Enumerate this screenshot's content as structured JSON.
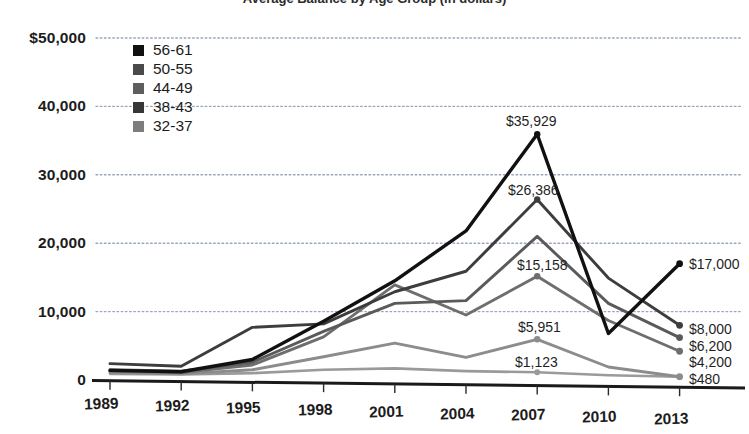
{
  "chart_data": {
    "type": "line",
    "title": "Average Balance by Age Group (in dollars)",
    "xlabel": "",
    "ylabel": "",
    "x": [
      "1989",
      "1992",
      "1995",
      "1998",
      "2001",
      "2004",
      "2007",
      "2010",
      "2013"
    ],
    "categories": [
      "1989",
      "1992",
      "1995",
      "1998",
      "2001",
      "2004",
      "2007",
      "2010",
      "2013"
    ],
    "ytick_labels": [
      "$50,000",
      "40,000",
      "30,000",
      "20,000",
      "10,000",
      "0"
    ],
    "ytick_values": [
      50000,
      40000,
      30000,
      20000,
      10000,
      0
    ],
    "ylim": [
      0,
      50000
    ],
    "grid": true,
    "legend_position": "upper-left-inside",
    "series": [
      {
        "name": "56-61",
        "color": "#111111",
        "values": [
          1400,
          1200,
          3000,
          8600,
          14500,
          21800,
          35929,
          6800,
          17000
        ],
        "end_label": "$17,000",
        "peak_label": "$35,929"
      },
      {
        "name": "50-55",
        "color": "#3d3d3d",
        "values": [
          2400,
          2000,
          7700,
          8200,
          12900,
          15900,
          26386,
          14900,
          8000
        ],
        "end_label": "$8,000",
        "peak_label": "$26,386"
      },
      {
        "name": "44-49",
        "color": "#5a5a5a",
        "values": [
          1500,
          1300,
          2600,
          7100,
          11200,
          11600,
          21000,
          11200,
          6200
        ],
        "end_label": "$6,200",
        "peak_label": ""
      },
      {
        "name": "38-43",
        "color": "#6e6e6e",
        "values": [
          1300,
          1100,
          2200,
          6300,
          13900,
          9500,
          15158,
          8700,
          4200
        ],
        "end_label": "$4,200",
        "peak_label": "$15,158"
      },
      {
        "name": "32-37",
        "color": "#8c8c8c",
        "values": [
          1100,
          900,
          1500,
          3400,
          5400,
          3300,
          5951,
          1900,
          480
        ],
        "end_label": "$480",
        "peak_label": "$5,951"
      }
    ],
    "annotations": [
      {
        "text": "$35,929",
        "series": "56-61",
        "x": "2007",
        "value": 35929
      },
      {
        "text": "$26,386",
        "series": "50-55",
        "x": "2007",
        "value": 26386
      },
      {
        "text": "$15,158",
        "series": "38-43",
        "x": "2007",
        "value": 15158
      },
      {
        "text": "$5,951",
        "series": "32-37",
        "x": "2007",
        "value": 5951
      },
      {
        "text": "$1,123",
        "series": "32-37-low",
        "x": "2007",
        "value": 1123
      },
      {
        "text": "$17,000",
        "series": "56-61",
        "x": "2013",
        "value": 17000
      },
      {
        "text": "$8,000",
        "series": "50-55",
        "x": "2013",
        "value": 8000
      },
      {
        "text": "$6,200",
        "series": "44-49",
        "x": "2013",
        "value": 6200
      },
      {
        "text": "$4,200",
        "series": "38-43",
        "x": "2013",
        "value": 4200
      },
      {
        "text": "$480",
        "series": "32-37",
        "x": "2013",
        "value": 480
      }
    ],
    "extra_line": {
      "name": "lowest-series",
      "color": "#9a9a9a",
      "values": [
        900,
        800,
        1000,
        1500,
        1700,
        1300,
        1123,
        700,
        480
      ]
    }
  },
  "legend": {
    "items": [
      {
        "label": "56-61",
        "color": "#111111"
      },
      {
        "label": "50-55",
        "color": "#4a4a4a"
      },
      {
        "label": "44-49",
        "color": "#5e5e5e"
      },
      {
        "label": "38-43",
        "color": "#373737"
      },
      {
        "label": "32-37",
        "color": "#7d7d7d"
      }
    ]
  }
}
